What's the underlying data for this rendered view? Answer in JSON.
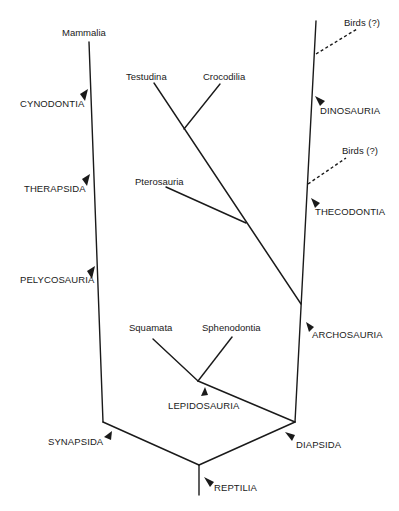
{
  "diagram": {
    "type": "cladogram",
    "taxa": {
      "mammalia": "Mammalia",
      "testudina": "Testudina",
      "crocodilia": "Crocodilia",
      "birds_upper": "Birds (?)",
      "birds_lower": "Birds (?)",
      "pterosauria": "Pterosauria",
      "squamata": "Squamata",
      "sphenodontia": "Sphenodontia"
    },
    "clades": {
      "cynodontia": "CYNODONTIA",
      "therapsida": "THERAPSIDA",
      "pelycosauria": "PELYCOSAURIA",
      "synapsida": "SYNAPSIDA",
      "reptilia": "REPTILIA",
      "diapsida": "DIAPSIDA",
      "lepidosauria": "LEPIDOSAURIA",
      "archosauria": "ARCHOSAURIA",
      "thecodontia": "THECODONTIA",
      "dinosauria": "DINOSAURIA"
    },
    "colors": {
      "line": "#1a1a1a",
      "background": "#ffffff"
    }
  }
}
